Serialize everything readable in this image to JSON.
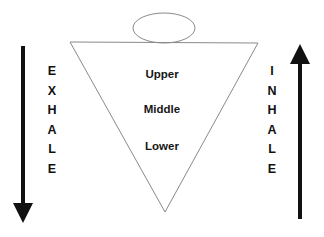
{
  "diagram": {
    "background_color": "#ffffff",
    "outline_color": "#7a7a7a",
    "arrow_color": "#111111",
    "text_color": "#161616",
    "left_side": {
      "arrow": "down-arrow",
      "label": "E\nX\nH\nA\nL\nE",
      "label_plain": "EXHALE"
    },
    "right_side": {
      "arrow": "up-arrow",
      "label": "I\nN\nH\nA\nL\nE",
      "label_plain": "INHALE"
    },
    "head": {
      "shape": "ellipse"
    },
    "body": {
      "shape": "inverted-triangle"
    },
    "zones": [
      {
        "label": "Upper"
      },
      {
        "label": "Middle"
      },
      {
        "label": "Lower"
      }
    ]
  }
}
